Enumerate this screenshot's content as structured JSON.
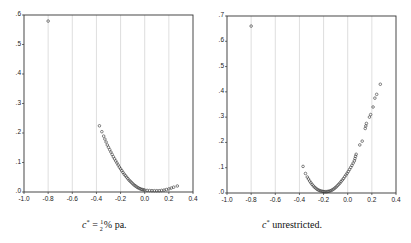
{
  "chart_data": [
    {
      "type": "scatter",
      "title": "",
      "caption": "c* = ½ % pa.",
      "caption_parts": {
        "var": "c",
        "sup": "*",
        "eq": " = ",
        "num": "1",
        "den": "2",
        "rest": "% pa."
      },
      "xlabel": "",
      "ylabel": "",
      "xlim": [
        -1.0,
        0.4
      ],
      "ylim": [
        0.0,
        0.6
      ],
      "xticks": [
        "-1.0",
        "-0.8",
        "-0.6",
        "-0.4",
        "-0.2",
        "0.0",
        "0.2",
        "0.4"
      ],
      "yticks": [
        ".0",
        ".1",
        ".2",
        ".3",
        ".4",
        ".5",
        ".6"
      ],
      "grid": "vertical",
      "points": [
        [
          -0.8,
          0.575
        ],
        [
          -0.375,
          0.22
        ],
        [
          -0.355,
          0.2
        ],
        [
          -0.34,
          0.185
        ],
        [
          -0.33,
          0.175
        ],
        [
          -0.32,
          0.165
        ],
        [
          -0.31,
          0.155
        ],
        [
          -0.3,
          0.147
        ],
        [
          -0.29,
          0.139
        ],
        [
          -0.28,
          0.131
        ],
        [
          -0.27,
          0.123
        ],
        [
          -0.26,
          0.115
        ],
        [
          -0.25,
          0.108
        ],
        [
          -0.24,
          0.101
        ],
        [
          -0.23,
          0.094
        ],
        [
          -0.22,
          0.087
        ],
        [
          -0.21,
          0.08
        ],
        [
          -0.2,
          0.074
        ],
        [
          -0.19,
          0.068
        ],
        [
          -0.18,
          0.062
        ],
        [
          -0.17,
          0.056
        ],
        [
          -0.16,
          0.051
        ],
        [
          -0.15,
          0.046
        ],
        [
          -0.14,
          0.041
        ],
        [
          -0.13,
          0.036
        ],
        [
          -0.12,
          0.032
        ],
        [
          -0.11,
          0.028
        ],
        [
          -0.1,
          0.024
        ],
        [
          -0.09,
          0.02
        ],
        [
          -0.08,
          0.017
        ],
        [
          -0.07,
          0.014
        ],
        [
          -0.06,
          0.011
        ],
        [
          -0.05,
          0.009
        ],
        [
          -0.04,
          0.007
        ],
        [
          -0.03,
          0.005
        ],
        [
          -0.02,
          0.004
        ],
        [
          -0.01,
          0.003
        ],
        [
          0.0,
          0.002
        ],
        [
          0.02,
          0.001
        ],
        [
          0.04,
          0.0005
        ],
        [
          0.06,
          0.0002
        ],
        [
          0.08,
          0.0
        ],
        [
          0.1,
          0.0
        ],
        [
          0.12,
          0.0
        ],
        [
          0.14,
          0.001
        ],
        [
          0.16,
          0.002
        ],
        [
          0.18,
          0.004
        ],
        [
          0.2,
          0.006
        ],
        [
          0.22,
          0.009
        ],
        [
          0.24,
          0.012
        ],
        [
          0.27,
          0.016
        ]
      ]
    },
    {
      "type": "scatter",
      "title": "",
      "caption": "c* unrestricted.",
      "caption_parts": {
        "var": "c",
        "sup": "*",
        "rest": " unrestricted."
      },
      "xlabel": "",
      "ylabel": "",
      "xlim": [
        -1.0,
        0.4
      ],
      "ylim": [
        0.0,
        0.7
      ],
      "xticks": [
        "-1.0",
        "-0.8",
        "-0.6",
        "-0.4",
        "-0.2",
        "0.0",
        "0.2",
        "0.4"
      ],
      "yticks": [
        ".0",
        ".1",
        ".2",
        ".3",
        ".4",
        ".5",
        ".6",
        ".7"
      ],
      "grid": "vertical",
      "points": [
        [
          -0.8,
          0.655
        ],
        [
          -0.37,
          0.1
        ],
        [
          -0.35,
          0.072
        ],
        [
          -0.335,
          0.058
        ],
        [
          -0.325,
          0.05
        ],
        [
          -0.315,
          0.042
        ],
        [
          -0.305,
          0.035
        ],
        [
          -0.295,
          0.029
        ],
        [
          -0.285,
          0.023
        ],
        [
          -0.275,
          0.018
        ],
        [
          -0.265,
          0.014
        ],
        [
          -0.255,
          0.01
        ],
        [
          -0.245,
          0.007
        ],
        [
          -0.235,
          0.005
        ],
        [
          -0.225,
          0.003
        ],
        [
          -0.215,
          0.002
        ],
        [
          -0.205,
          0.001
        ],
        [
          -0.195,
          0.0
        ],
        [
          -0.185,
          0.0
        ],
        [
          -0.175,
          0.0
        ],
        [
          -0.165,
          0.001
        ],
        [
          -0.155,
          0.002
        ],
        [
          -0.145,
          0.003
        ],
        [
          -0.135,
          0.005
        ],
        [
          -0.125,
          0.008
        ],
        [
          -0.115,
          0.011
        ],
        [
          -0.105,
          0.015
        ],
        [
          -0.095,
          0.019
        ],
        [
          -0.085,
          0.024
        ],
        [
          -0.075,
          0.029
        ],
        [
          -0.065,
          0.034
        ],
        [
          -0.055,
          0.04
        ],
        [
          -0.045,
          0.046
        ],
        [
          -0.035,
          0.052
        ],
        [
          -0.025,
          0.059
        ],
        [
          -0.015,
          0.066
        ],
        [
          -0.005,
          0.073
        ],
        [
          0.005,
          0.08
        ],
        [
          0.015,
          0.088
        ],
        [
          0.025,
          0.096
        ],
        [
          0.035,
          0.104
        ],
        [
          0.045,
          0.113
        ],
        [
          0.055,
          0.122
        ],
        [
          0.06,
          0.131
        ],
        [
          0.065,
          0.14
        ],
        [
          0.07,
          0.148
        ],
        [
          0.1,
          0.185
        ],
        [
          0.12,
          0.2
        ],
        [
          0.145,
          0.25
        ],
        [
          0.15,
          0.26
        ],
        [
          0.155,
          0.27
        ],
        [
          0.18,
          0.295
        ],
        [
          0.19,
          0.305
        ],
        [
          0.21,
          0.335
        ],
        [
          0.225,
          0.37
        ],
        [
          0.24,
          0.385
        ],
        [
          0.27,
          0.425
        ]
      ]
    }
  ]
}
